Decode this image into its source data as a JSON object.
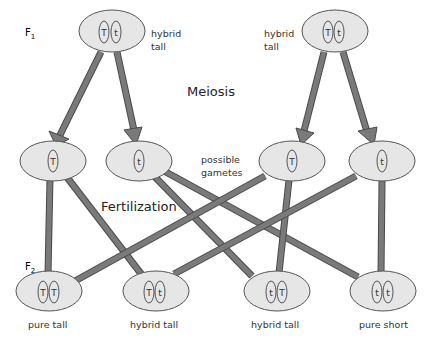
{
  "diagram": {
    "colors": {
      "cell_fill": "#e6e6e6",
      "cell_stroke": "#555555",
      "connector": "#7a7a7a",
      "connector_edge": "#4a4a4a",
      "text": "#333333"
    },
    "generation_labels": {
      "f1": {
        "base": "F",
        "sub": "1"
      },
      "f2": {
        "base": "F",
        "sub": "2"
      }
    },
    "process_labels": {
      "meiosis": "Meiosis",
      "fertilization": "Fertilization",
      "gametes": [
        "possible",
        "gametes"
      ]
    },
    "parents": [
      {
        "id": "f1-left",
        "alleles": [
          "T",
          "t"
        ],
        "label": [
          "hybrid",
          "tall"
        ]
      },
      {
        "id": "f1-right",
        "alleles": [
          "T",
          "t"
        ],
        "label": [
          "hybrid",
          "tall"
        ]
      }
    ],
    "gametes": [
      {
        "id": "g1",
        "allele": "T",
        "from": "f1-left"
      },
      {
        "id": "g2",
        "allele": "t",
        "from": "f1-left"
      },
      {
        "id": "g3",
        "allele": "T",
        "from": "f1-right"
      },
      {
        "id": "g4",
        "allele": "t",
        "from": "f1-right"
      }
    ],
    "offspring": [
      {
        "id": "o1",
        "alleles": [
          "T",
          "T"
        ],
        "label": "pure tall"
      },
      {
        "id": "o2",
        "alleles": [
          "T",
          "t"
        ],
        "label": "hybrid tall"
      },
      {
        "id": "o3",
        "alleles": [
          "t",
          "T"
        ],
        "label": "hybrid tall"
      },
      {
        "id": "o4",
        "alleles": [
          "t",
          "t"
        ],
        "label": "pure short"
      }
    ],
    "fertilization_links": [
      [
        "g1",
        "o1"
      ],
      [
        "g1",
        "o2"
      ],
      [
        "g2",
        "o3"
      ],
      [
        "g2",
        "o4"
      ],
      [
        "g3",
        "o1"
      ],
      [
        "g3",
        "o3"
      ],
      [
        "g4",
        "o2"
      ],
      [
        "g4",
        "o4"
      ]
    ]
  }
}
